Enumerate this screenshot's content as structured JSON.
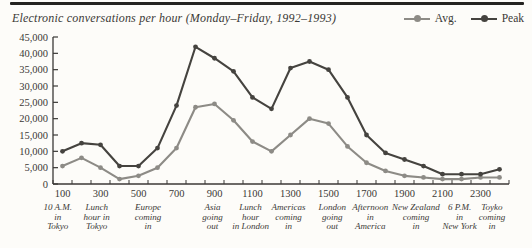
{
  "page": {
    "background": "#fdfcf9",
    "top_rule_color": "#242320"
  },
  "header": {
    "title": "Electronic conversations per hour (Monday–Friday, 1992–1993)"
  },
  "legend": {
    "items": [
      {
        "label": "Avg.",
        "color": "#8d8b86"
      },
      {
        "label": "Peak",
        "color": "#45433f"
      }
    ]
  },
  "chart_data": {
    "type": "line",
    "title": "Electronic conversations per hour (Monday–Friday, 1992–1993)",
    "xlabel": "",
    "ylabel": "",
    "x": [
      100,
      200,
      300,
      400,
      500,
      600,
      700,
      800,
      900,
      1000,
      1100,
      1200,
      1300,
      1400,
      1500,
      1600,
      1700,
      1800,
      1900,
      2000,
      2100,
      2200,
      2300,
      2400
    ],
    "x_tick_labels": [
      "100",
      "300",
      "500",
      "700",
      "900",
      "1100",
      "1300",
      "1500",
      "1700",
      "1900",
      "2100",
      "2300"
    ],
    "x_tick_label_values": [
      100,
      300,
      500,
      700,
      900,
      1100,
      1300,
      1500,
      1700,
      1900,
      2100,
      2300
    ],
    "ylim": [
      0,
      45000
    ],
    "y_ticks": [
      0,
      5000,
      10000,
      15000,
      20000,
      25000,
      30000,
      35000,
      40000,
      45000
    ],
    "y_tick_labels": [
      "0",
      "5,000",
      "10,000",
      "15,000",
      "20,000",
      "25,000",
      "30,000",
      "35,000",
      "40,000",
      "45,000"
    ],
    "grid": "off",
    "legend_position": "top-right",
    "axis_color": "#3b3936",
    "text_color": "#3b3936",
    "series": [
      {
        "name": "Avg.",
        "color": "#8d8b86",
        "values": [
          5500,
          8000,
          5000,
          1500,
          2500,
          5000,
          11000,
          23500,
          24500,
          19500,
          13000,
          10000,
          15000,
          20000,
          18500,
          11500,
          6500,
          4000,
          2500,
          2000,
          1500,
          1500,
          2000,
          2000
        ]
      },
      {
        "name": "Peak",
        "color": "#45433f",
        "values": [
          10000,
          12500,
          12000,
          5500,
          5500,
          11000,
          24000,
          42000,
          38500,
          34500,
          26500,
          23000,
          35500,
          37500,
          35000,
          26500,
          15000,
          9500,
          7500,
          5500,
          3000,
          3000,
          3000,
          4500
        ]
      }
    ],
    "annotations": [
      {
        "at": 75,
        "lines": [
          "10 A.M.",
          "in",
          "Tokyo"
        ]
      },
      {
        "at": 280,
        "lines": [
          "Lunch",
          "hour in",
          "Tokyo"
        ]
      },
      {
        "at": 550,
        "lines": [
          "Europe",
          "coming",
          "in"
        ]
      },
      {
        "at": 890,
        "lines": [
          "Asia",
          "going",
          "out"
        ]
      },
      {
        "at": 1090,
        "lines": [
          "Lunch",
          "hour",
          "in London"
        ]
      },
      {
        "at": 1290,
        "lines": [
          "Americas",
          "coming",
          "in"
        ]
      },
      {
        "at": 1520,
        "lines": [
          "London",
          "going",
          "out"
        ]
      },
      {
        "at": 1720,
        "lines": [
          "Afternoon",
          "in",
          "America"
        ]
      },
      {
        "at": 1960,
        "lines": [
          "New Zealand",
          "coming",
          "in"
        ]
      },
      {
        "at": 2190,
        "lines": [
          "6 P.M.",
          "in",
          "New York"
        ]
      },
      {
        "at": 2360,
        "lines": [
          "Toyko",
          "coming",
          "in"
        ]
      }
    ]
  }
}
